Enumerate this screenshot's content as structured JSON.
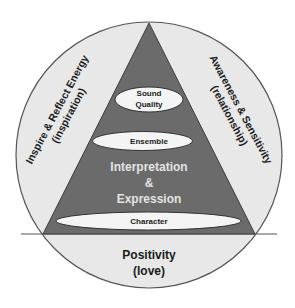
{
  "diagram": {
    "colors": {
      "circle_fill": "#e8e8e8",
      "circle_stroke": "#555555",
      "triangle_fill": "#6b6b6b",
      "triangle_stroke": "#3c3c3c",
      "ellipse_fill": "#f4f4f4",
      "ellipse_stroke": "#333333",
      "dark_text": "#1a1a1a",
      "light_text": "#e4e4e4"
    },
    "pyramid_levels": {
      "top": {
        "line1": "Sound",
        "line2": "Quality"
      },
      "second": {
        "label": "Ensemble"
      },
      "center": {
        "line1": "Interpretation",
        "line2": "&",
        "line3": "Expression"
      },
      "base": {
        "label": "Character"
      }
    },
    "outer_segments": {
      "left": {
        "line1": "Inspire & Reflect Energy",
        "line2": "(inspiration)"
      },
      "right": {
        "line1": "Awareness & Sensitivity",
        "line2": "(relationship)"
      },
      "bottom": {
        "line1": "Positivity",
        "line2": "(love)"
      }
    }
  }
}
